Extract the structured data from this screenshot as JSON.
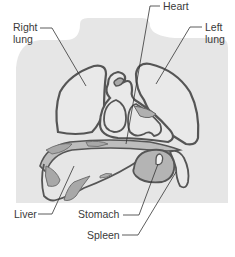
{
  "figure": {
    "colors": {
      "body_fill": "#e6e6e6",
      "organ_outline": "#555555",
      "organ_fill": "#e9e9e9",
      "tissue_fill": "#a8a8a8",
      "leader_line": "#333333",
      "label_text": "#3a3a3a"
    }
  },
  "labels": {
    "right_lung": {
      "line1": "Right",
      "line2": "lung"
    },
    "heart": "Heart",
    "left_lung": {
      "line1": "Left",
      "line2": "lung"
    },
    "liver": "Liver",
    "stomach": "Stomach",
    "spleen": "Spleen"
  }
}
